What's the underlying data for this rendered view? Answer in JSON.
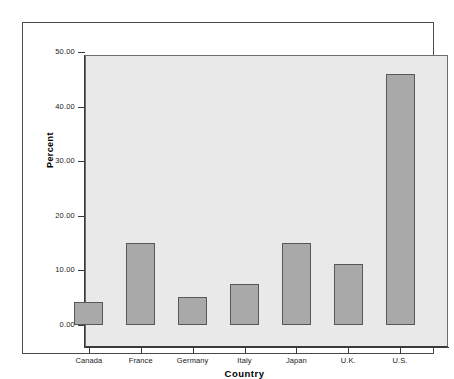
{
  "chart_data": {
    "type": "bar",
    "title": "",
    "subtitle": "",
    "xlabel": "Country",
    "ylabel": "Percent",
    "categories": [
      "Canada",
      "France",
      "Germany",
      "Italy",
      "Japan",
      "U.K.",
      "U.S."
    ],
    "values": [
      4.2,
      15.0,
      5.2,
      7.5,
      15.0,
      11.2,
      46.0
    ],
    "ylim": [
      0,
      53
    ],
    "yticks": [
      0,
      10,
      20,
      30,
      40,
      50
    ],
    "ytick_labels": [
      "0.00",
      "10.00",
      "20.00",
      "30.00",
      "40.00",
      "50.00"
    ],
    "grid": false,
    "legend": null,
    "bar_fill_color": "#a9a9a9",
    "bar_border_color": "#585858",
    "plot_background_color": "#e9e9e9",
    "axis_color": "#3a3a3a",
    "frame_color": "#4a4a4a"
  }
}
